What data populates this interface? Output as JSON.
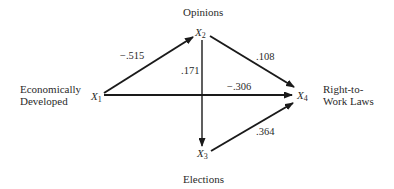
{
  "diagram": {
    "type": "path-diagram",
    "nodes": [
      {
        "id": "X1",
        "symbol": "X",
        "index": "1",
        "label_lines": [
          "Economically",
          "Developed"
        ]
      },
      {
        "id": "X2",
        "symbol": "X",
        "index": "2",
        "label_lines": [
          "Opinions"
        ]
      },
      {
        "id": "X3",
        "symbol": "X",
        "index": "3",
        "label_lines": [
          "Elections"
        ]
      },
      {
        "id": "X4",
        "symbol": "X",
        "index": "4",
        "label_lines": [
          "Right-to-",
          "Work Laws"
        ]
      }
    ],
    "edges": [
      {
        "from": "X1",
        "to": "X2",
        "coefficient": "−.515"
      },
      {
        "from": "X2",
        "to": "X3",
        "coefficient": ".171"
      },
      {
        "from": "X2",
        "to": "X4",
        "coefficient": ".108"
      },
      {
        "from": "X1",
        "to": "X4",
        "coefficient": "−.306"
      },
      {
        "from": "X3",
        "to": "X4",
        "coefficient": ".364"
      }
    ],
    "line_color": "#1a1a1a"
  }
}
